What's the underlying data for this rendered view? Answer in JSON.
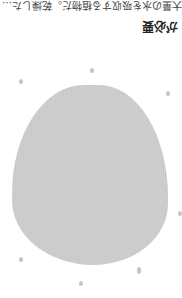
{
  "title": "が必要",
  "body_text": "大量の水を吸収する植物だ。乾燥した…",
  "colors": {
    "background": "#ffffff",
    "blob": "#cccccc",
    "text": "#222222"
  },
  "orientation": "rotated 180°"
}
